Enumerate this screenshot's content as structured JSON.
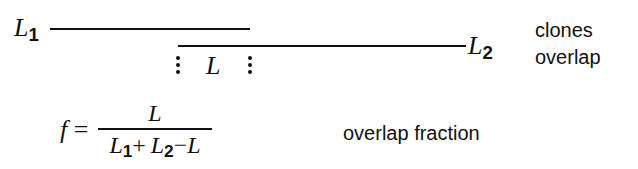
{
  "diagram": {
    "clone1": {
      "symbol": "L",
      "subscript": "1"
    },
    "clone2": {
      "symbol": "L",
      "subscript": "2"
    },
    "overlap_symbol": "L",
    "right_labels": {
      "line1": "clones",
      "line2": "overlap"
    }
  },
  "formula": {
    "lhs": "f",
    "equals": "=",
    "numerator": "L",
    "denominator": {
      "t1": "L",
      "t1_sub": "1",
      "plus": "+",
      "t2": "L",
      "t2_sub": "2",
      "minus": "−",
      "t3": "L"
    },
    "label": "overlap fraction"
  },
  "colors": {
    "ink": "#111111",
    "background": "#ffffff"
  }
}
